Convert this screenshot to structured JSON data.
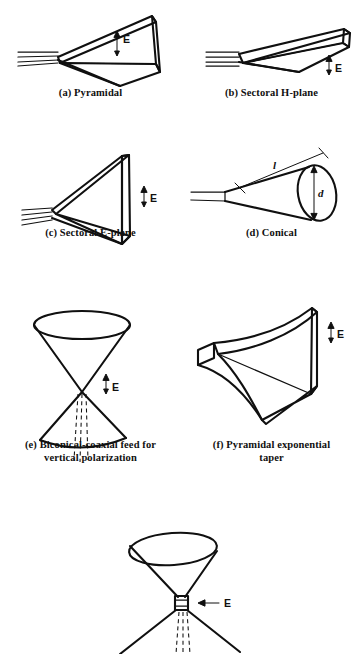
{
  "figure": {
    "background_color": "#ffffff",
    "ink_color": "#101010"
  },
  "panels": [
    {
      "id": "a",
      "caption": "(a) Pyramidal",
      "field_label": "E",
      "field_direction": "vertical",
      "feed": "rectangular waveguide"
    },
    {
      "id": "b",
      "caption": "(b) Sectoral H-plane",
      "field_label": "E",
      "field_direction": "vertical",
      "feed": "rectangular waveguide"
    },
    {
      "id": "c",
      "caption": "(c) Sectoral E-plane",
      "field_label": "E",
      "field_direction": "vertical",
      "feed": "rectangular waveguide"
    },
    {
      "id": "d",
      "caption": "(d) Conical",
      "dimension_length": "l",
      "dimension_diameter": "d",
      "feed": "circular waveguide"
    },
    {
      "id": "e",
      "caption": "(e) Biconical-coaxial feed for\nvertical polarization",
      "field_label": "E",
      "field_direction": "vertical",
      "feed": "coaxial line"
    },
    {
      "id": "f",
      "caption": "(f) Pyramidal exponential\ntaper",
      "field_label": "E",
      "field_direction": "vertical"
    },
    {
      "id": "g",
      "caption": "",
      "field_label": "E",
      "field_direction": "horizontal",
      "feed": "coaxial line"
    }
  ]
}
